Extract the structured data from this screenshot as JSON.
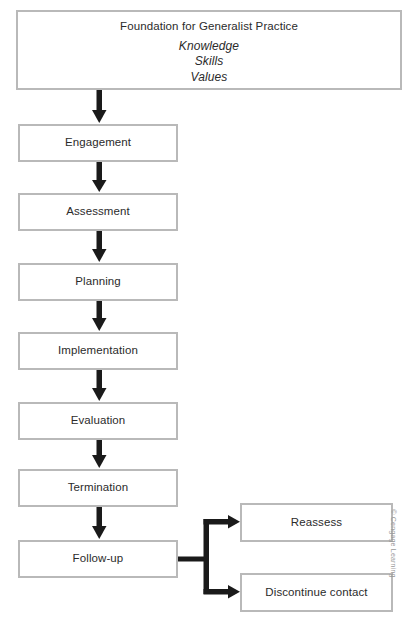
{
  "diagram": {
    "title_box": {
      "title": "Foundation for Generalist Practice",
      "items": [
        "Knowledge",
        "Skills",
        "Values"
      ]
    },
    "steps": [
      {
        "label": "Engagement"
      },
      {
        "label": "Assessment"
      },
      {
        "label": "Planning"
      },
      {
        "label": "Implementation"
      },
      {
        "label": "Evaluation"
      },
      {
        "label": "Termination"
      },
      {
        "label": "Follow-up"
      }
    ],
    "branches": [
      {
        "label": "Reassess"
      },
      {
        "label": "Discontinue contact"
      }
    ],
    "credit": "© Cengage Learning",
    "colors": {
      "box_border": "#b9b9b9",
      "arrow": "#1a1a1a",
      "text": "#2b2b2b",
      "credit_text": "#9a9a9a",
      "background": "#ffffff"
    }
  }
}
